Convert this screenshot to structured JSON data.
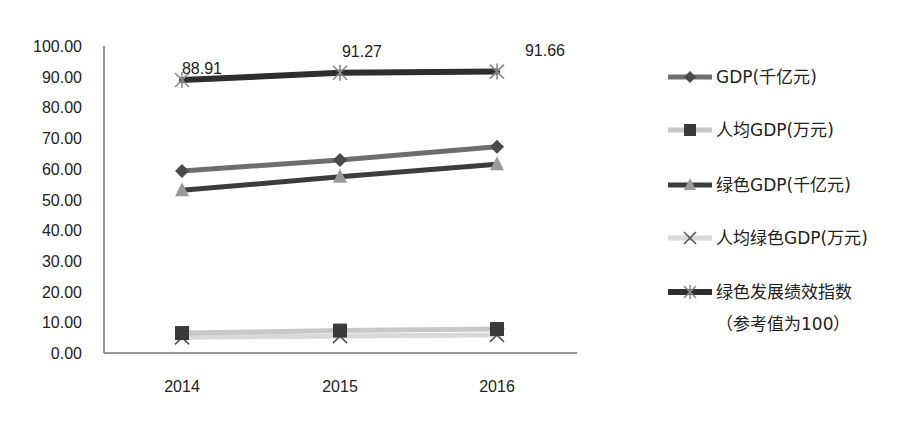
{
  "chart_data": {
    "type": "line",
    "title": "",
    "xlabel": "",
    "ylabel": "",
    "categories": [
      "2014",
      "2015",
      "2016"
    ],
    "ylim": [
      0,
      100
    ],
    "yticks": [
      "0.00",
      "10.00",
      "20.00",
      "30.00",
      "40.00",
      "50.00",
      "60.00",
      "70.00",
      "80.00",
      "90.00",
      "100.00"
    ],
    "grid": false,
    "legend_position": "right",
    "series": [
      {
        "name": "GDP(千亿元)",
        "values": [
          59.3,
          62.9,
          67.2
        ],
        "color": "#6e6e6e",
        "marker": "diamond",
        "marker_color": "#4a4a4a",
        "line_width": 5
      },
      {
        "name": "人均GDP(万元)",
        "values": [
          6.5,
          7.3,
          7.8
        ],
        "color": "#c8c8c8",
        "marker": "square",
        "marker_color": "#3a3a3a",
        "line_width": 5
      },
      {
        "name": "绿色GDP(千亿元)",
        "values": [
          53.0,
          57.4,
          61.5
        ],
        "color": "#3c3c3c",
        "marker": "triangle",
        "marker_color": "#9a9a9a",
        "line_width": 5
      },
      {
        "name": "人均绿色GDP(万元)",
        "values": [
          5.1,
          5.5,
          5.9
        ],
        "color": "#d9d9d9",
        "marker": "x",
        "marker_color": "#555555",
        "line_width": 5
      },
      {
        "name": "绿色发展绩效指数",
        "name_line2": "（参考值为100）",
        "values": [
          88.91,
          91.27,
          91.66
        ],
        "color": "#2e2e2e",
        "marker": "asterisk",
        "marker_color": "#8a8a8a",
        "line_width": 6
      }
    ],
    "annotations": [
      {
        "series": 4,
        "index": 0,
        "text": "88.91"
      },
      {
        "series": 4,
        "index": 1,
        "text": "91.27"
      },
      {
        "series": 4,
        "index": 2,
        "text": "91.66"
      }
    ]
  }
}
